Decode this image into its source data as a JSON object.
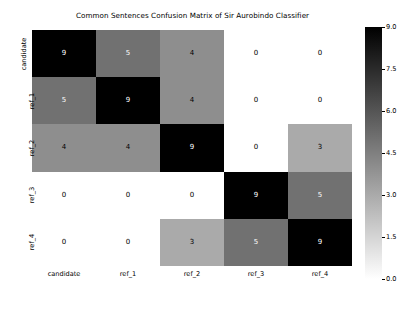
{
  "chart_data": {
    "type": "heatmap",
    "title": "Common Sentences Confusion Matrix of Sir Aurobindo Classifier",
    "xlabel": "",
    "ylabel": "",
    "x_categories": [
      "candidate",
      "ref_1",
      "ref_2",
      "ref_3",
      "ref_4"
    ],
    "y_categories": [
      "candidate",
      "ref_1",
      "ref_2",
      "ref_3",
      "ref_4"
    ],
    "values": [
      [
        9,
        5,
        4,
        0,
        0
      ],
      [
        5,
        9,
        4,
        0,
        0
      ],
      [
        4,
        4,
        9,
        0,
        3
      ],
      [
        0,
        0,
        0,
        9,
        5
      ],
      [
        0,
        0,
        3,
        5,
        9
      ]
    ],
    "colormap": "gray_reversed",
    "colorbar": {
      "min": 0.0,
      "max": 9.0,
      "ticks": [
        "0.0",
        "1.5",
        "3.0",
        "4.5",
        "6.0",
        "7.5",
        "9.0"
      ],
      "tick_values": [
        0.0,
        1.5,
        3.0,
        4.5,
        6.0,
        7.5,
        9.0
      ],
      "position": "right",
      "high_color": "#000000",
      "low_color": "#ffffff"
    },
    "grid": false,
    "legend": "colorbar"
  }
}
